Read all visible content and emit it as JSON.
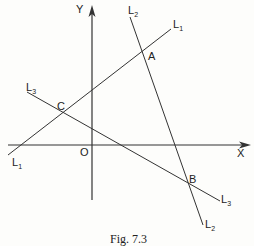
{
  "figure": {
    "caption": "Fig. 7.3",
    "axes": {
      "x_label": "X",
      "y_label": "Y",
      "origin_label": "O"
    },
    "lines": [
      {
        "name": "L",
        "sub": "1"
      },
      {
        "name": "L",
        "sub": "2"
      },
      {
        "name": "L",
        "sub": "3"
      }
    ],
    "points": {
      "A": "A",
      "B": "B",
      "C": "C"
    }
  }
}
